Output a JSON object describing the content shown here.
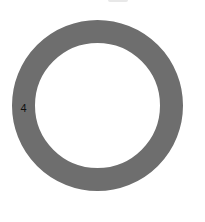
{
  "chart_data": {
    "type": "pie",
    "subtype": "donut",
    "title": "",
    "categories": [
      "4"
    ],
    "values": [
      100
    ],
    "labels": [
      {
        "text": "4",
        "position": "left"
      }
    ],
    "colors": [
      "#6e6e6e"
    ],
    "legend": null,
    "grid": false
  },
  "colors": {
    "ring": "#6e6e6e",
    "background": "#ffffff",
    "label": "#111111"
  },
  "geometry": {
    "center_x": 97.5,
    "center_y": 105,
    "outer_diameter": 171,
    "ring_thickness": 23
  }
}
